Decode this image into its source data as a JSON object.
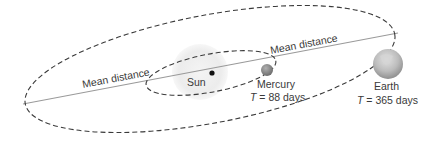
{
  "diagram": {
    "type": "orbital diagram",
    "labels": {
      "mean_distance_outer": "Mean distance",
      "mean_distance_inner": "Mean distance",
      "sun": "Sun",
      "mercury": "Mercury",
      "mercury_period_var": "T",
      "mercury_period_value": " = 88 days",
      "earth": "Earth",
      "earth_period_var": "T",
      "earth_period_value": " = 365 days"
    },
    "bodies": [
      {
        "name": "Sun",
        "role": "focus"
      },
      {
        "name": "Mercury",
        "period_days": 88
      },
      {
        "name": "Earth",
        "period_days": 365
      }
    ],
    "colors": {
      "orbit_stroke": "#3a3a3a",
      "axis_line": "#9a9a9a",
      "sun_glow": "#ececec",
      "mercury": "#8a8a8a",
      "earth": "#b5b5b5",
      "text": "#3a3a3a"
    }
  }
}
